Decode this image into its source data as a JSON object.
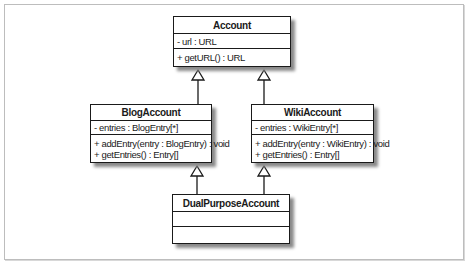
{
  "diagram": {
    "type": "UML class diagram",
    "relationship": "generalization",
    "classes": {
      "account": {
        "name": "Account",
        "attributes": [
          "- url : URL"
        ],
        "operations": [
          "+ getURL() : URL"
        ]
      },
      "blog_account": {
        "name": "BlogAccount",
        "attributes": [
          "- entries : BlogEntry[*]"
        ],
        "operations": [
          "+ addEntry(entry : BlogEntry) : void",
          "+ getEntries() : Entry[]"
        ]
      },
      "wiki_account": {
        "name": "WikiAccount",
        "attributes": [
          "- entries : WikiEntry[*]"
        ],
        "operations": [
          "+ addEntry(entry : WikiEntry) : void",
          "+ getEntries() : Entry[]"
        ]
      },
      "dual_purpose_account": {
        "name": "DualPurposeAccount",
        "attributes": [],
        "operations": []
      }
    },
    "inheritance": [
      {
        "child": "BlogAccount",
        "parent": "Account"
      },
      {
        "child": "WikiAccount",
        "parent": "Account"
      },
      {
        "child": "DualPurposeAccount",
        "parent": "BlogAccount"
      },
      {
        "child": "DualPurposeAccount",
        "parent": "WikiAccount"
      }
    ]
  }
}
